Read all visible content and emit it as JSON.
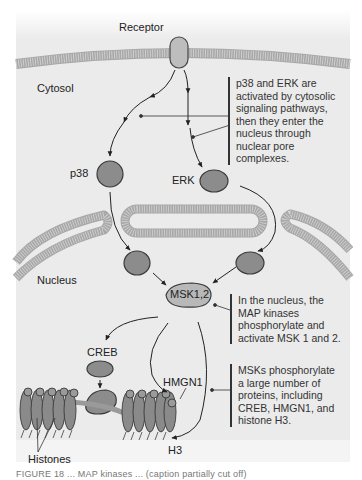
{
  "labels": {
    "receptor": "Receptor",
    "cytosol": "Cytosol",
    "nucleus": "Nucleus",
    "p38": "p38",
    "erk": "ERK",
    "msk": "MSK1,2",
    "creb": "CREB",
    "hmgn1": "HMGN1",
    "h3": "H3",
    "histones": "Histones"
  },
  "notes": {
    "cytosol_note": {
      "lines": [
        "p38 and ERK are",
        "activated by cytosolic",
        "signaling pathways,",
        "then they enter the",
        "nucleus through",
        "nuclear pore",
        "complexes."
      ]
    },
    "nucleus_note": {
      "lines": [
        "In the nucleus, the",
        "MAP kinases",
        "phosphorylate and",
        "activate MSK 1 and 2."
      ]
    },
    "substrate_note": {
      "lines": [
        "MSKs phosphorylate",
        "a large number of",
        "proteins, including",
        "CREB, HMGN1, and",
        "histone H3."
      ]
    }
  },
  "caption": "FIGURE 18 ... MAP kinases ... (caption partially cut off)",
  "colors": {
    "background": "#ebebeb",
    "membrane": "#b3b3b3",
    "protein_fill": "#8c8c8c",
    "protein_stroke": "#3a3a3a",
    "receptor_fill": "#bdbdbd",
    "text": "#222222"
  }
}
